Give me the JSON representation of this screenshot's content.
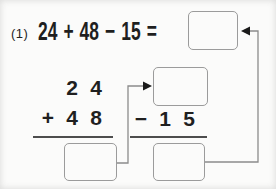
{
  "problem": {
    "number_label": "(1)",
    "expression_tokens": [
      "24",
      "+",
      "48",
      "−",
      "15",
      "="
    ],
    "answer_value": ""
  },
  "addition": {
    "rows": [
      [
        "",
        "2",
        "4"
      ],
      [
        "+",
        "4",
        "8"
      ]
    ],
    "result_value": ""
  },
  "subtraction": {
    "minuend_value": "",
    "row": [
      "−",
      "1",
      "5"
    ],
    "result_value": ""
  },
  "colors": {
    "background": "#fbfbfa",
    "text": "#1f1f1f",
    "box_border": "#9b9b9b",
    "underline": "#4d4d4d",
    "line": "#8c8c8c",
    "arrowhead": "#1a1a1a"
  }
}
